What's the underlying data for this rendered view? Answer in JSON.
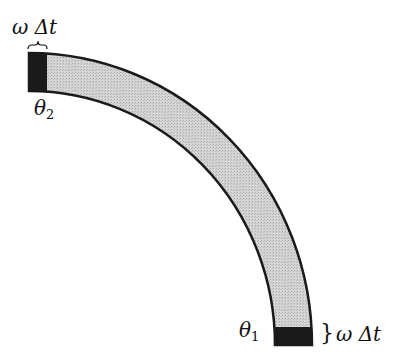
{
  "diagram": {
    "type": "curved band (quarter annulus) with shaded end segments",
    "colors": {
      "band_fill": "#d4d4d4",
      "end_fill": "#1a1a1a",
      "outline": "#1a1a1a"
    },
    "labels": {
      "top_width": "ω Δt",
      "top_angle": "θ",
      "top_angle_sub": "2",
      "bottom_angle": "θ",
      "bottom_angle_sub": "1",
      "bottom_width_brace": "}",
      "bottom_width": "ω Δt"
    }
  }
}
